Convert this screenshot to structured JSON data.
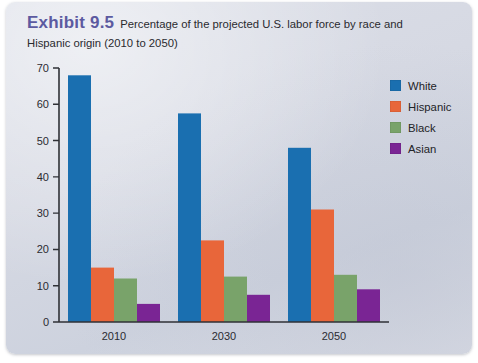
{
  "exhibit": {
    "label": "Exhibit 9.5",
    "caption": "Percentage of the projected U.S. labor force by race and Hispanic origin (2010 to 2050)",
    "label_color": "#5c5aa0"
  },
  "chart_data": {
    "type": "bar",
    "title": "Percentage of the projected U.S. labor force by race and Hispanic origin (2010 to 2050)",
    "xlabel": "",
    "ylabel": "",
    "ylim": [
      0,
      70
    ],
    "yticks": [
      0,
      10,
      20,
      30,
      40,
      50,
      60,
      70
    ],
    "ytick_labels": [
      "0",
      "10",
      "20",
      "30",
      "40",
      "50",
      "60",
      "70"
    ],
    "grid": false,
    "legend_position": "top-right",
    "categories": [
      "2010",
      "2030",
      "2050"
    ],
    "series": [
      {
        "name": "White",
        "color": "#1a6fb0",
        "values": [
          68,
          57.5,
          48
        ]
      },
      {
        "name": "Hispanic",
        "color": "#e8663a",
        "values": [
          15,
          22.5,
          31
        ]
      },
      {
        "name": "Black",
        "color": "#79a36a",
        "values": [
          12,
          12.5,
          13
        ]
      },
      {
        "name": "Asian",
        "color": "#7a2594",
        "values": [
          5,
          7.5,
          9
        ]
      }
    ]
  }
}
